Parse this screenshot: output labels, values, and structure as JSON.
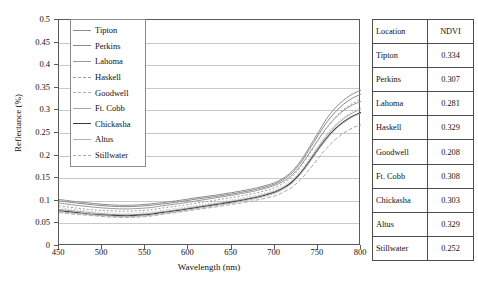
{
  "chart_data": {
    "type": "line",
    "title": "",
    "xlabel": "Wavelength (nm)",
    "ylabel": "Reflectance (%)",
    "xlim": [
      450,
      800
    ],
    "ylim": [
      0,
      0.5
    ],
    "xticks": [
      450,
      500,
      550,
      600,
      650,
      700,
      750,
      800
    ],
    "xtick_labels": [
      "450",
      "500",
      "550",
      "600",
      "650",
      "700",
      "750",
      "800"
    ],
    "yticks": [
      0,
      0.05,
      0.1,
      0.15,
      0.2,
      0.25,
      0.3,
      0.35,
      0.4,
      0.45,
      0.5
    ],
    "ytick_labels": [
      "0",
      "0.05",
      "0.1",
      "0.15",
      "0.2",
      "0.25",
      "0.3",
      "0.35",
      "0.4",
      "0.45",
      "0.5"
    ],
    "grid": "horizontal",
    "legend_position": "upper-left-inside",
    "x": [
      450,
      470,
      490,
      510,
      530,
      550,
      560,
      570,
      590,
      610,
      630,
      650,
      670,
      680,
      690,
      700,
      710,
      720,
      730,
      740,
      750,
      760,
      770,
      780,
      790,
      800
    ],
    "series": [
      {
        "name": "Tipton",
        "color": "#8d8d8d",
        "dash": "none",
        "width": 1.0,
        "values": [
          0.103,
          0.098,
          0.094,
          0.091,
          0.09,
          0.092,
          0.094,
          0.096,
          0.101,
          0.107,
          0.112,
          0.118,
          0.125,
          0.129,
          0.134,
          0.14,
          0.15,
          0.165,
          0.188,
          0.218,
          0.25,
          0.281,
          0.305,
          0.323,
          0.336,
          0.345
        ]
      },
      {
        "name": "Perkins",
        "color": "#8a8a8a",
        "dash": "none",
        "width": 1.0,
        "values": [
          0.1,
          0.095,
          0.091,
          0.088,
          0.087,
          0.089,
          0.091,
          0.093,
          0.098,
          0.104,
          0.109,
          0.115,
          0.122,
          0.126,
          0.131,
          0.137,
          0.147,
          0.162,
          0.184,
          0.213,
          0.244,
          0.273,
          0.296,
          0.314,
          0.327,
          0.336
        ]
      },
      {
        "name": "Lahoma",
        "color": "#9a9a9a",
        "dash": "none",
        "width": 1.0,
        "values": [
          0.095,
          0.09,
          0.086,
          0.083,
          0.082,
          0.084,
          0.086,
          0.089,
          0.094,
          0.1,
          0.106,
          0.112,
          0.119,
          0.123,
          0.128,
          0.134,
          0.143,
          0.157,
          0.178,
          0.205,
          0.234,
          0.261,
          0.283,
          0.3,
          0.312,
          0.32
        ]
      },
      {
        "name": "Haskell",
        "color": "#9e9e9e",
        "dash": "2,2",
        "width": 1.0,
        "values": [
          0.089,
          0.084,
          0.08,
          0.078,
          0.077,
          0.079,
          0.081,
          0.084,
          0.089,
          0.095,
          0.101,
          0.107,
          0.114,
          0.118,
          0.123,
          0.129,
          0.139,
          0.153,
          0.175,
          0.203,
          0.233,
          0.261,
          0.284,
          0.302,
          0.315,
          0.325
        ]
      },
      {
        "name": "Goodwell",
        "color": "#b0b0b0",
        "dash": "1,2",
        "width": 1.0,
        "values": [
          0.085,
          0.08,
          0.076,
          0.073,
          0.072,
          0.074,
          0.076,
          0.079,
          0.084,
          0.09,
          0.096,
          0.102,
          0.109,
          0.113,
          0.118,
          0.124,
          0.133,
          0.146,
          0.167,
          0.193,
          0.221,
          0.247,
          0.268,
          0.285,
          0.297,
          0.306
        ]
      },
      {
        "name": "Ft. Cobb",
        "color": "#a5a5a5",
        "dash": "none",
        "width": 1.0,
        "values": [
          0.081,
          0.077,
          0.073,
          0.07,
          0.069,
          0.071,
          0.073,
          0.076,
          0.081,
          0.087,
          0.093,
          0.099,
          0.106,
          0.11,
          0.115,
          0.121,
          0.13,
          0.143,
          0.163,
          0.189,
          0.217,
          0.243,
          0.265,
          0.282,
          0.294,
          0.303
        ]
      },
      {
        "name": "Chickasha",
        "color": "#3c3c3c",
        "dash": "none",
        "width": 1.1,
        "values": [
          0.078,
          0.074,
          0.07,
          0.068,
          0.067,
          0.069,
          0.071,
          0.074,
          0.079,
          0.085,
          0.091,
          0.097,
          0.104,
          0.108,
          0.113,
          0.119,
          0.128,
          0.141,
          0.161,
          0.186,
          0.213,
          0.238,
          0.259,
          0.275,
          0.287,
          0.296
        ]
      },
      {
        "name": "Altus",
        "color": "#b5b5b5",
        "dash": "none",
        "width": 1.0,
        "values": [
          0.076,
          0.072,
          0.069,
          0.066,
          0.065,
          0.067,
          0.069,
          0.072,
          0.077,
          0.083,
          0.089,
          0.095,
          0.102,
          0.106,
          0.111,
          0.117,
          0.126,
          0.139,
          0.159,
          0.184,
          0.211,
          0.236,
          0.257,
          0.273,
          0.285,
          0.294
        ]
      },
      {
        "name": "Stillwater",
        "color": "#aaaaaa",
        "dash": "4,2",
        "width": 1.0,
        "values": [
          0.074,
          0.07,
          0.067,
          0.064,
          0.063,
          0.065,
          0.067,
          0.07,
          0.075,
          0.081,
          0.086,
          0.092,
          0.098,
          0.102,
          0.106,
          0.111,
          0.119,
          0.13,
          0.147,
          0.169,
          0.193,
          0.216,
          0.235,
          0.25,
          0.261,
          0.268
        ]
      }
    ]
  },
  "legend": {
    "items": [
      {
        "label": "Tipton"
      },
      {
        "label": "Perkins"
      },
      {
        "label": "Lahoma"
      },
      {
        "label": "Haskell"
      },
      {
        "label": "Goodwell"
      },
      {
        "label": "Ft. Cobb"
      },
      {
        "label": "Chickasha"
      },
      {
        "label": "Altus"
      },
      {
        "label": "Stillwater"
      }
    ]
  },
  "ndvi_table": {
    "headers": [
      "Location",
      "NDVI"
    ],
    "rows": [
      {
        "location": "Tipton",
        "ndvi": "0.334"
      },
      {
        "location": "Perkins",
        "ndvi": "0.307"
      },
      {
        "location": "Lahoma",
        "ndvi": "0.281"
      },
      {
        "location": "Haskell",
        "ndvi": "0.329"
      },
      {
        "location": "Goodwell",
        "ndvi": "0.208"
      },
      {
        "location": "Ft. Cobb",
        "ndvi": "0.308"
      },
      {
        "location": "Chickasha",
        "ndvi": "0.303"
      },
      {
        "location": "Altus",
        "ndvi": "0.329"
      },
      {
        "location": "Stillwater",
        "ndvi": "0.252"
      }
    ]
  }
}
